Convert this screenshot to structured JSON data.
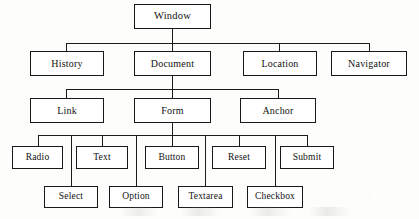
{
  "diagram": {
    "type": "tree",
    "style": {
      "box_border_color": "#181818",
      "line_color": "#1c1c1c",
      "background": "#fdfdfc",
      "text_color": "#111111"
    },
    "levels": [
      {
        "level": 1,
        "nodes": [
          {
            "id": "window",
            "label": "Window",
            "x": 134,
            "y": 4,
            "w": 77,
            "h": 25
          }
        ]
      },
      {
        "level": 2,
        "nodes": [
          {
            "id": "history",
            "label": "History",
            "x": 30,
            "y": 51,
            "w": 74,
            "h": 25
          },
          {
            "id": "document",
            "label": "Document",
            "x": 134,
            "y": 51,
            "w": 77,
            "h": 25
          },
          {
            "id": "location",
            "label": "Location",
            "x": 243,
            "y": 51,
            "w": 74,
            "h": 25
          },
          {
            "id": "navigator",
            "label": "Navigator",
            "x": 331,
            "y": 51,
            "w": 76,
            "h": 25
          }
        ]
      },
      {
        "level": 3,
        "nodes": [
          {
            "id": "link",
            "label": "Link",
            "x": 30,
            "y": 98,
            "w": 74,
            "h": 25
          },
          {
            "id": "form",
            "label": "Form",
            "x": 134,
            "y": 98,
            "w": 77,
            "h": 25
          },
          {
            "id": "anchor",
            "label": "Anchor",
            "x": 240,
            "y": 98,
            "w": 76,
            "h": 25
          }
        ]
      },
      {
        "level": 4,
        "nodes": [
          {
            "id": "radio",
            "label": "Radio",
            "x": 12,
            "y": 146,
            "w": 51,
            "h": 23
          },
          {
            "id": "text",
            "label": "Text",
            "x": 76,
            "y": 146,
            "w": 52,
            "h": 23
          },
          {
            "id": "button",
            "label": "Button",
            "x": 145,
            "y": 146,
            "w": 54,
            "h": 23
          },
          {
            "id": "reset",
            "label": "Reset",
            "x": 212,
            "y": 146,
            "w": 54,
            "h": 23
          },
          {
            "id": "submit",
            "label": "Submit",
            "x": 280,
            "y": 146,
            "w": 54,
            "h": 23
          }
        ]
      },
      {
        "level": 5,
        "nodes": [
          {
            "id": "select",
            "label": "Select",
            "x": 44,
            "y": 186,
            "w": 54,
            "h": 22
          },
          {
            "id": "option",
            "label": "Option",
            "x": 109,
            "y": 186,
            "w": 54,
            "h": 22
          },
          {
            "id": "textarea",
            "label": "Textarea",
            "x": 178,
            "y": 186,
            "w": 55,
            "h": 22
          },
          {
            "id": "checkbox",
            "label": "Checkbox",
            "x": 247,
            "y": 186,
            "w": 56,
            "h": 22
          }
        ]
      }
    ],
    "edges": [
      {
        "from": "window",
        "to": "history"
      },
      {
        "from": "window",
        "to": "document"
      },
      {
        "from": "window",
        "to": "location"
      },
      {
        "from": "window",
        "to": "navigator"
      },
      {
        "from": "document",
        "to": "link"
      },
      {
        "from": "document",
        "to": "form"
      },
      {
        "from": "document",
        "to": "anchor"
      },
      {
        "from": "form",
        "to": "radio"
      },
      {
        "from": "form",
        "to": "text"
      },
      {
        "from": "form",
        "to": "button"
      },
      {
        "from": "form",
        "to": "reset"
      },
      {
        "from": "form",
        "to": "submit"
      },
      {
        "from": "form",
        "to": "select"
      },
      {
        "from": "form",
        "to": "option"
      },
      {
        "from": "form",
        "to": "textarea"
      },
      {
        "from": "form",
        "to": "checkbox"
      }
    ]
  }
}
